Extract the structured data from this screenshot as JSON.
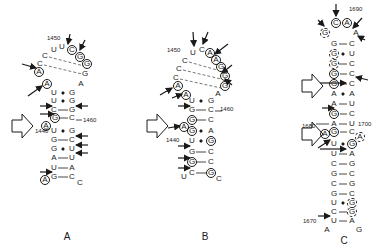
{
  "panels": [
    {
      "label": "A",
      "label_pos": [
        67,
        236
      ],
      "numbers": [
        {
          "text": "1450",
          "x": 47,
          "y": 38
        },
        {
          "text": "1460",
          "x": 83,
          "y": 120
        },
        {
          "text": "1440",
          "x": 35,
          "y": 131
        }
      ],
      "nucleotides": [
        {
          "b": "U",
          "x": 54,
          "y": 50,
          "s": ""
        },
        {
          "b": "U",
          "x": 62,
          "y": 47,
          "s": ""
        },
        {
          "b": "C",
          "x": 72,
          "y": 50,
          "s": "c"
        },
        {
          "b": "G",
          "x": 80,
          "y": 57,
          "s": "c"
        },
        {
          "b": "G",
          "x": 87,
          "y": 64,
          "s": "c"
        },
        {
          "b": "C",
          "x": 45,
          "y": 56,
          "s": ""
        },
        {
          "b": "C",
          "x": 40,
          "y": 64,
          "s": ""
        },
        {
          "b": "G",
          "x": 85,
          "y": 74,
          "s": ""
        },
        {
          "b": "A",
          "x": 81,
          "y": 84,
          "s": ""
        },
        {
          "b": "A",
          "x": 39,
          "y": 72,
          "s": "c"
        },
        {
          "b": "A",
          "x": 47,
          "y": 84,
          "s": "c"
        },
        {
          "b": "U",
          "x": 54,
          "y": 93,
          "s": ""
        },
        {
          "b": "G",
          "x": 72,
          "y": 93,
          "s": ""
        },
        {
          "b": "U",
          "x": 54,
          "y": 101,
          "s": ""
        },
        {
          "b": "G",
          "x": 72,
          "y": 101,
          "s": ""
        },
        {
          "b": "C",
          "x": 54,
          "y": 110,
          "s": ""
        },
        {
          "b": "G",
          "x": 72,
          "y": 110,
          "s": ""
        },
        {
          "b": "G",
          "x": 55,
          "y": 118,
          "s": "c"
        },
        {
          "b": "C",
          "x": 72,
          "y": 118,
          "s": ""
        },
        {
          "b": "A",
          "x": 46,
          "y": 126,
          "s": "c"
        },
        {
          "b": "U",
          "x": 54,
          "y": 131,
          "s": ""
        },
        {
          "b": "G",
          "x": 72,
          "y": 131,
          "s": ""
        },
        {
          "b": "G",
          "x": 54,
          "y": 140,
          "s": ""
        },
        {
          "b": "C",
          "x": 72,
          "y": 140,
          "s": ""
        },
        {
          "b": "G",
          "x": 54,
          "y": 149,
          "s": ""
        },
        {
          "b": "U",
          "x": 72,
          "y": 149,
          "s": ""
        },
        {
          "b": "A",
          "x": 54,
          "y": 158,
          "s": ""
        },
        {
          "b": "U",
          "x": 72,
          "y": 158,
          "s": ""
        },
        {
          "b": "U",
          "x": 54,
          "y": 168,
          "s": ""
        },
        {
          "b": "A",
          "x": 72,
          "y": 168,
          "s": ""
        },
        {
          "b": "A",
          "x": 45,
          "y": 180,
          "s": "c"
        },
        {
          "b": "G",
          "x": 54,
          "y": 177,
          "s": ""
        },
        {
          "b": "C",
          "x": 72,
          "y": 177,
          "s": ""
        },
        {
          "b": "C",
          "x": 80,
          "y": 183,
          "s": ""
        }
      ]
    },
    {
      "label": "B",
      "label_pos": [
        205,
        236
      ],
      "numbers": [
        {
          "text": "1450",
          "x": 167,
          "y": 50
        },
        {
          "text": "1460",
          "x": 220,
          "y": 109
        },
        {
          "text": "1440",
          "x": 166,
          "y": 140
        }
      ],
      "nucleotides": [
        {
          "b": "U",
          "x": 193,
          "y": 53,
          "s": ""
        },
        {
          "b": "C",
          "x": 202,
          "y": 50,
          "s": ""
        },
        {
          "b": "A",
          "x": 210,
          "y": 53,
          "s": "c"
        },
        {
          "b": "A",
          "x": 216,
          "y": 60,
          "s": "c"
        },
        {
          "b": "G",
          "x": 221,
          "y": 67,
          "s": "c"
        },
        {
          "b": "C",
          "x": 185,
          "y": 61,
          "s": ""
        },
        {
          "b": "C",
          "x": 179,
          "y": 69,
          "s": ""
        },
        {
          "b": "C",
          "x": 176,
          "y": 78,
          "s": ""
        },
        {
          "b": "G",
          "x": 225,
          "y": 76,
          "s": "c"
        },
        {
          "b": "G",
          "x": 225,
          "y": 86,
          "s": "c"
        },
        {
          "b": "A",
          "x": 218,
          "y": 94,
          "s": ""
        },
        {
          "b": "A",
          "x": 178,
          "y": 86,
          "s": "c"
        },
        {
          "b": "A",
          "x": 186,
          "y": 95,
          "s": "c"
        },
        {
          "b": "U",
          "x": 192,
          "y": 101,
          "s": ""
        },
        {
          "b": "G",
          "x": 211,
          "y": 101,
          "s": ""
        },
        {
          "b": "G",
          "x": 192,
          "y": 110,
          "s": ""
        },
        {
          "b": "C",
          "x": 211,
          "y": 110,
          "s": ""
        },
        {
          "b": "G",
          "x": 192,
          "y": 120,
          "s": "c"
        },
        {
          "b": "C",
          "x": 211,
          "y": 120,
          "s": ""
        },
        {
          "b": "A",
          "x": 184,
          "y": 127,
          "s": "c"
        },
        {
          "b": "G",
          "x": 192,
          "y": 131,
          "s": "c"
        },
        {
          "b": "A",
          "x": 211,
          "y": 131,
          "s": ""
        },
        {
          "b": "U",
          "x": 192,
          "y": 141,
          "s": ""
        },
        {
          "b": "G",
          "x": 211,
          "y": 141,
          "s": "c"
        },
        {
          "b": "G",
          "x": 192,
          "y": 152,
          "s": ""
        },
        {
          "b": "C",
          "x": 211,
          "y": 152,
          "s": ""
        },
        {
          "b": "G",
          "x": 192,
          "y": 162,
          "s": "c"
        },
        {
          "b": "C",
          "x": 211,
          "y": 162,
          "s": ""
        },
        {
          "b": "U",
          "x": 184,
          "y": 177,
          "s": ""
        },
        {
          "b": "C",
          "x": 192,
          "y": 173,
          "s": ""
        },
        {
          "b": "G",
          "x": 211,
          "y": 173,
          "s": "c"
        },
        {
          "b": "C",
          "x": 219,
          "y": 179,
          "s": ""
        }
      ]
    },
    {
      "label": "C",
      "label_pos": [
        344,
        240
      ],
      "numbers": [
        {
          "text": "1690",
          "x": 349,
          "y": 9
        },
        {
          "text": "1680",
          "x": 302,
          "y": 126
        },
        {
          "text": "1700",
          "x": 358,
          "y": 124
        },
        {
          "text": "1670",
          "x": 303,
          "y": 221
        }
      ],
      "nucleotides": [
        {
          "b": "G",
          "x": 325,
          "y": 33,
          "s": "d"
        },
        {
          "b": "C",
          "x": 336,
          "y": 23,
          "s": "c"
        },
        {
          "b": "A",
          "x": 347,
          "y": 23,
          "s": "c"
        },
        {
          "b": "A",
          "x": 356,
          "y": 33,
          "s": ""
        },
        {
          "b": "G",
          "x": 334,
          "y": 44,
          "s": ""
        },
        {
          "b": "C",
          "x": 352,
          "y": 44,
          "s": ""
        },
        {
          "b": "G",
          "x": 334,
          "y": 54,
          "s": "d"
        },
        {
          "b": "U",
          "x": 352,
          "y": 54,
          "s": ""
        },
        {
          "b": "G",
          "x": 334,
          "y": 64,
          "s": "d"
        },
        {
          "b": "C",
          "x": 352,
          "y": 64,
          "s": ""
        },
        {
          "b": "G",
          "x": 334,
          "y": 74,
          "s": "c"
        },
        {
          "b": "C",
          "x": 352,
          "y": 74,
          "s": ""
        },
        {
          "b": "G",
          "x": 334,
          "y": 84,
          "s": "c"
        },
        {
          "b": "C",
          "x": 352,
          "y": 84,
          "s": ""
        },
        {
          "b": "A",
          "x": 334,
          "y": 94,
          "s": ""
        },
        {
          "b": "A",
          "x": 352,
          "y": 94,
          "s": ""
        },
        {
          "b": "A",
          "x": 334,
          "y": 104,
          "s": ""
        },
        {
          "b": "U",
          "x": 352,
          "y": 104,
          "s": ""
        },
        {
          "b": "G",
          "x": 334,
          "y": 114,
          "s": "c"
        },
        {
          "b": "C",
          "x": 352,
          "y": 114,
          "s": ""
        },
        {
          "b": "A",
          "x": 334,
          "y": 124,
          "s": ""
        },
        {
          "b": "U",
          "x": 352,
          "y": 124,
          "s": ""
        },
        {
          "b": "A",
          "x": 325,
          "y": 134,
          "s": "c"
        },
        {
          "b": "G",
          "x": 334,
          "y": 132,
          "s": "c"
        },
        {
          "b": "C",
          "x": 352,
          "y": 132,
          "s": ""
        },
        {
          "b": "A",
          "x": 360,
          "y": 137,
          "s": "d"
        },
        {
          "b": "U",
          "x": 334,
          "y": 144,
          "s": ""
        },
        {
          "b": "G",
          "x": 352,
          "y": 144,
          "s": "c"
        },
        {
          "b": "U",
          "x": 334,
          "y": 154,
          "s": ""
        },
        {
          "b": "A",
          "x": 352,
          "y": 154,
          "s": ""
        },
        {
          "b": "C",
          "x": 334,
          "y": 164,
          "s": ""
        },
        {
          "b": "G",
          "x": 352,
          "y": 164,
          "s": ""
        },
        {
          "b": "G",
          "x": 334,
          "y": 174,
          "s": ""
        },
        {
          "b": "C",
          "x": 352,
          "y": 174,
          "s": ""
        },
        {
          "b": "C",
          "x": 334,
          "y": 184,
          "s": ""
        },
        {
          "b": "G",
          "x": 352,
          "y": 184,
          "s": ""
        },
        {
          "b": "G",
          "x": 334,
          "y": 194,
          "s": ""
        },
        {
          "b": "C",
          "x": 352,
          "y": 194,
          "s": ""
        },
        {
          "b": "U",
          "x": 334,
          "y": 203,
          "s": ""
        },
        {
          "b": "G",
          "x": 352,
          "y": 203,
          "s": "d"
        },
        {
          "b": "C",
          "x": 334,
          "y": 212,
          "s": ""
        },
        {
          "b": "G",
          "x": 352,
          "y": 212,
          "s": "d"
        },
        {
          "b": "U",
          "x": 334,
          "y": 221,
          "s": ""
        },
        {
          "b": "A",
          "x": 352,
          "y": 221,
          "s": ""
        },
        {
          "b": "A",
          "x": 327,
          "y": 230,
          "s": ""
        },
        {
          "b": "G",
          "x": 359,
          "y": 230,
          "s": ""
        }
      ]
    }
  ]
}
